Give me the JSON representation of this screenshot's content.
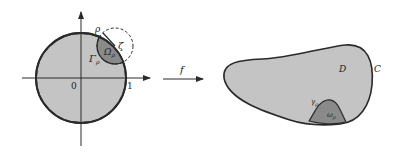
{
  "diagram": {
    "left": {
      "origin_label": "0",
      "unit_label": "1",
      "rho_label": "ρ",
      "zeta_label": "ζ",
      "omega_label": "Ω",
      "omega_sub": "ρ",
      "gamma_label": "Γ",
      "gamma_sub": "ρ"
    },
    "map": {
      "label": "f"
    },
    "right": {
      "domain_label": "D",
      "curve_label": "C",
      "gamma_label": "γ",
      "gamma_sub": "ρ",
      "omega_label": "ω",
      "omega_sub": "ρ"
    },
    "colors": {
      "fill_light": "#c4c4c4",
      "fill_dark": "#8a8a8a",
      "stroke": "#2a2a2a"
    }
  }
}
